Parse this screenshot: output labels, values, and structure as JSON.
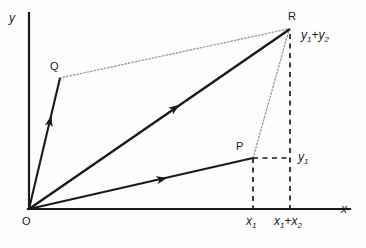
{
  "figure": {
    "type": "vector-addition-parallelogram-diagram",
    "background_color": "#fdfdfd",
    "stroke_color": "#1a1a1a",
    "dotted_color": "#9a9a9a",
    "dashed_color": "#1a1a1a"
  },
  "axes": {
    "x_label": "x",
    "y_label": "y",
    "origin_label": "O",
    "x_axis": {
      "x1": 29,
      "y1": 209,
      "x2": 350,
      "y2": 209
    },
    "y_axis": {
      "x1": 29,
      "y1": 13,
      "x2": 29,
      "y2": 209
    }
  },
  "points": {
    "O": {
      "label": "O",
      "x": 29,
      "y": 209
    },
    "P": {
      "label": "P",
      "x": 253,
      "y": 158
    },
    "Q": {
      "label": "Q",
      "x": 60,
      "y": 78
    },
    "R": {
      "label": "R",
      "x": 290,
      "y": 28
    }
  },
  "vectors": [
    {
      "name": "OP",
      "from": "O",
      "to": "P",
      "style": "solid-arrow",
      "arrow_at": {
        "x": 155,
        "y": 182
      }
    },
    {
      "name": "OQ",
      "from": "O",
      "to": "Q",
      "style": "solid-arrow",
      "arrow_at": {
        "x": 48,
        "y": 133
      }
    },
    {
      "name": "OR",
      "from": "O",
      "to": "R",
      "style": "solid-arrow",
      "arrow_at": {
        "x": 168,
        "y": 113
      }
    }
  ],
  "construction_lines": [
    {
      "name": "QR",
      "from": "Q",
      "to": "R",
      "style": "dotted"
    },
    {
      "name": "PR",
      "from": "P",
      "to": "R",
      "style": "dotted"
    }
  ],
  "projection_lines": [
    {
      "name": "P-to-x-axis",
      "style": "dashed",
      "x1": 253,
      "y1": 158,
      "x2": 253,
      "y2": 209
    },
    {
      "name": "P-to-y1-level",
      "style": "dashed",
      "x1": 253,
      "y1": 158,
      "x2": 291,
      "y2": 158
    },
    {
      "name": "R-to-x-axis",
      "style": "dashed",
      "x1": 290,
      "y1": 34,
      "x2": 290,
      "y2": 209
    }
  ],
  "coordinate_labels": {
    "y1_at_P": {
      "base": "y",
      "sub": "1"
    },
    "y1_plus_y2_at_R": {
      "term1_base": "y",
      "term1_sub": "1",
      "operator": "+",
      "term2_base": "y",
      "term2_sub": "2"
    },
    "x1_on_axis": {
      "base": "x",
      "sub": "1"
    },
    "x1_plus_x2_on_axis": {
      "term1_base": "x",
      "term1_sub": "1",
      "operator": "+",
      "term2_base": "x",
      "term2_sub": "2"
    }
  }
}
